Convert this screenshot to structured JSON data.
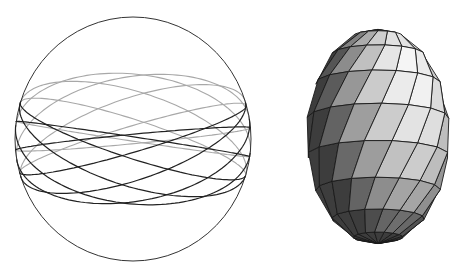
{
  "figure": {
    "panels": [
      {
        "id": "sphere-wireframe",
        "description": "Wireframe sphere outline with a band of tilted great-circle curves",
        "outline_color": "#333333",
        "back_curve_color": "#a8a8a8",
        "front_curve_color": "#222222",
        "curve_count": 8,
        "inclination_deg": 18
      },
      {
        "id": "lemon-surface",
        "description": "Shaded twisted lemon-shaped polyhedral surface",
        "edge_color": "#1a1a1a",
        "meridians": 16,
        "rings": 9,
        "twist_turns": 0.35,
        "shade_dark": "#2a2a2a",
        "shade_light": "#f4f4f4"
      }
    ]
  }
}
